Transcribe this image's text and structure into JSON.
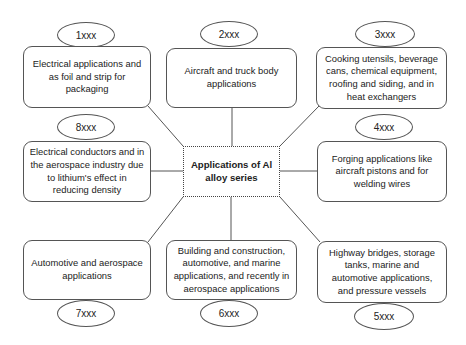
{
  "center": {
    "label": "Applications of Al alloy series"
  },
  "series": [
    {
      "id": "1xxx",
      "label": "1xxx",
      "description": "Electrical applications and as foil and strip for packaging"
    },
    {
      "id": "2xxx",
      "label": "2xxx",
      "description": "Aircraft and truck body applications"
    },
    {
      "id": "3xxx",
      "label": "3xxx",
      "description": "Cooking utensils, beverage cans, chemical equipment, roofing and siding, and in heat exchangers"
    },
    {
      "id": "4xxx",
      "label": "4xxx",
      "description": "Forging applications like aircraft pistons and for welding wires"
    },
    {
      "id": "5xxx",
      "label": "5xxx",
      "description": "Highway bridges, storage tanks, marine and automotive applications, and pressure vessels"
    },
    {
      "id": "6xxx",
      "label": "6xxx",
      "description": "Building and construction, automotive, and marine applications, and recently in aerospace applications"
    },
    {
      "id": "7xxx",
      "label": "7xxx",
      "description": "Automotive and aerospace applications"
    },
    {
      "id": "8xxx",
      "label": "8xxx",
      "description": "Electrical conductors and in the aerospace industry due to lithium's effect in reducing density"
    }
  ]
}
